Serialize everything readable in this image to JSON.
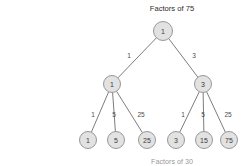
{
  "diagram": {
    "title": "Factors of 75",
    "bottom_caption": "Factors of 30",
    "background_color": "#ffffff",
    "node_fill_color": "#e2e2e2",
    "node_stroke_color": "#8d8d8d",
    "edge_color": "#6e6e6e",
    "text_color": "#3a3a3a"
  },
  "chart_data": {
    "type": "diagram",
    "title": "Factors of 75",
    "nodes": [
      {
        "id": "root",
        "label": "1",
        "level": 0,
        "x": 163,
        "y": 31,
        "r": 9.5
      },
      {
        "id": "l1a",
        "label": "1",
        "level": 1,
        "x": 112,
        "y": 84,
        "r": 8.5
      },
      {
        "id": "l1b",
        "label": "3",
        "level": 1,
        "x": 203,
        "y": 84,
        "r": 8.5
      },
      {
        "id": "l2a",
        "label": "1",
        "level": 2,
        "x": 88,
        "y": 140,
        "r": 8.5
      },
      {
        "id": "l2b",
        "label": "5",
        "level": 2,
        "x": 116,
        "y": 140,
        "r": 8.5
      },
      {
        "id": "l2c",
        "label": "25",
        "level": 2,
        "x": 147,
        "y": 140,
        "r": 8.5
      },
      {
        "id": "l2d",
        "label": "3",
        "level": 2,
        "x": 176,
        "y": 140,
        "r": 8.5
      },
      {
        "id": "l2e",
        "label": "15",
        "level": 2,
        "x": 204,
        "y": 140,
        "r": 8.5
      },
      {
        "id": "l2f",
        "label": "75",
        "level": 2,
        "x": 229,
        "y": 140,
        "r": 8.5
      }
    ],
    "edges": [
      {
        "from": "root",
        "to": "l1a",
        "label": "1",
        "label_x": 129,
        "label_y": 55
      },
      {
        "from": "root",
        "to": "l1b",
        "label": "3",
        "label_x": 194,
        "label_y": 55
      },
      {
        "from": "l1a",
        "to": "l2a",
        "label": "1",
        "label_x": 93,
        "label_y": 114
      },
      {
        "from": "l1a",
        "to": "l2b",
        "label": "5",
        "label_x": 114,
        "label_y": 114
      },
      {
        "from": "l1a",
        "to": "l2c",
        "label": "25",
        "label_x": 141,
        "label_y": 114
      },
      {
        "from": "l1b",
        "to": "l2d",
        "label": "1",
        "label_x": 183,
        "label_y": 114
      },
      {
        "from": "l1b",
        "to": "l2e",
        "label": "5",
        "label_x": 203,
        "label_y": 114
      },
      {
        "from": "l1b",
        "to": "l2f",
        "label": "25",
        "label_x": 228,
        "label_y": 114
      }
    ],
    "title_position": {
      "x": 172,
      "y": 8
    },
    "caption_position": {
      "x": 172,
      "y": 161
    }
  }
}
